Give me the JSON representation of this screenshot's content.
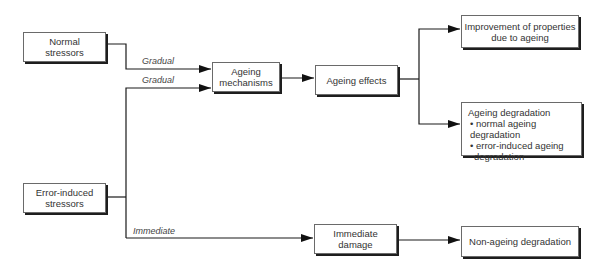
{
  "diagram": {
    "nodes": {
      "normal_stressors": {
        "line1": "Normal",
        "line2": "stressors"
      },
      "error_stressors": {
        "line1": "Error-induced",
        "line2": "stressors"
      },
      "ageing_mechanisms": {
        "line1": "Ageing",
        "line2": "mechanisms"
      },
      "ageing_effects": {
        "text": "Ageing effects"
      },
      "improvement": {
        "line1": "Improvement of properties",
        "line2": "due to ageing"
      },
      "ageing_degradation": {
        "title": "Ageing degradation",
        "items": [
          "• normal ageing degradation",
          "• error-induced ageing",
          "degradation"
        ]
      },
      "immediate_damage": {
        "line1": "Immediate",
        "line2": "damage"
      },
      "non_ageing": {
        "text": "Non-ageing degradation"
      }
    },
    "edge_labels": {
      "gradual_1": "Gradual",
      "gradual_2": "Gradual",
      "immediate": "Immediate"
    },
    "edges": [
      {
        "from": "Normal stressors",
        "to": "Ageing mechanisms",
        "label": "Gradual"
      },
      {
        "from": "Error-induced stressors",
        "to": "Ageing mechanisms",
        "label": "Gradual"
      },
      {
        "from": "Error-induced stressors",
        "to": "Immediate damage",
        "label": "Immediate"
      },
      {
        "from": "Ageing mechanisms",
        "to": "Ageing effects"
      },
      {
        "from": "Ageing effects",
        "to": "Improvement of properties due to ageing"
      },
      {
        "from": "Ageing effects",
        "to": "Ageing degradation"
      },
      {
        "from": "Immediate damage",
        "to": "Non-ageing degradation"
      }
    ],
    "colors": {
      "line": "#1a1a1a",
      "border": "#6a6a6a",
      "shadow": "#1e1e1e",
      "text": "#333333"
    }
  }
}
